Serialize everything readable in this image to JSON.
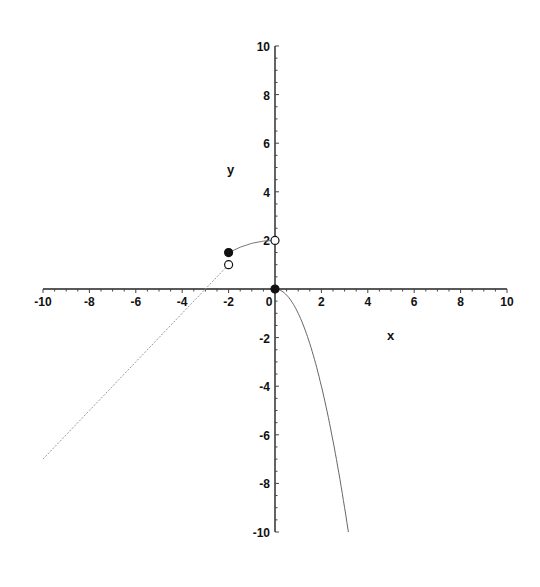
{
  "chart_data": {
    "type": "line",
    "title": "",
    "xlabel": "x",
    "ylabel": "y",
    "xlim": [
      -10,
      10
    ],
    "ylim": [
      -10,
      10
    ],
    "grid": false,
    "legend": null,
    "x_ticks": [
      -10,
      -8,
      -6,
      -4,
      -2,
      0,
      2,
      4,
      6,
      8,
      10
    ],
    "x_tick_labels": [
      "-10",
      "-8",
      "-6",
      "-4",
      "-2",
      "0",
      "2",
      "4",
      "6",
      "8",
      "10"
    ],
    "y_ticks": [
      10,
      8,
      6,
      4,
      2,
      -2,
      -4,
      -6,
      -8,
      -10
    ],
    "y_tick_labels": [
      "10",
      "8",
      "6",
      "4",
      "2",
      "-2",
      "-4",
      "-6",
      "-8",
      "-10"
    ],
    "series": [
      {
        "name": "left linear piece",
        "description": "y = x + 3 for x < -2",
        "x": [
          -10,
          -8,
          -6,
          -4,
          -3,
          -2
        ],
        "y": [
          -7,
          -5,
          -3,
          -1,
          0,
          1
        ]
      },
      {
        "name": "middle piece",
        "description": "curve from (-2, 1.5) to (0, 2)",
        "x": [
          -2,
          -1.5,
          -1,
          -0.5,
          0
        ],
        "y": [
          1.5,
          1.72,
          1.88,
          1.97,
          2
        ]
      },
      {
        "name": "right piece",
        "description": "y = -x^2 for x >= 0",
        "x": [
          0,
          0.5,
          1,
          1.5,
          2,
          2.5,
          3,
          3.16
        ],
        "y": [
          0,
          -0.25,
          -1,
          -2.25,
          -4,
          -6.25,
          -9,
          -10
        ]
      }
    ],
    "points": [
      {
        "x": -2,
        "y": 1.5,
        "style": "filled"
      },
      {
        "x": -2,
        "y": 1,
        "style": "open"
      },
      {
        "x": 0,
        "y": 2,
        "style": "open"
      },
      {
        "x": 0,
        "y": 0,
        "style": "filled"
      }
    ]
  },
  "axes": {
    "x_label": "x",
    "y_label": "y"
  }
}
